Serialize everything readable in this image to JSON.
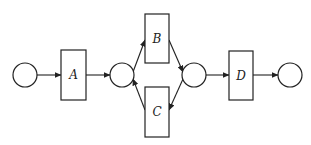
{
  "diagram": {
    "type": "petri-net",
    "colors": {
      "stroke": "#222222",
      "background": "#ffffff"
    },
    "places": [
      {
        "id": "p1",
        "cx": 25,
        "cy": 75,
        "r": 12
      },
      {
        "id": "p2",
        "cx": 122,
        "cy": 75,
        "r": 12
      },
      {
        "id": "p3",
        "cx": 194,
        "cy": 75,
        "r": 12
      },
      {
        "id": "p4",
        "cx": 290,
        "cy": 75,
        "r": 12
      }
    ],
    "transitions": [
      {
        "id": "A",
        "label": "A",
        "x": 61,
        "y": 50,
        "w": 25,
        "h": 50
      },
      {
        "id": "B",
        "label": "B",
        "x": 145,
        "y": 14,
        "w": 24,
        "h": 49
      },
      {
        "id": "C",
        "label": "C",
        "x": 145,
        "y": 87,
        "w": 24,
        "h": 50
      },
      {
        "id": "D",
        "label": "D",
        "x": 229,
        "y": 51,
        "w": 24,
        "h": 49
      }
    ],
    "arcs": [
      {
        "from": "p1",
        "to": "A"
      },
      {
        "from": "A",
        "to": "p2"
      },
      {
        "from": "p2",
        "to": "B"
      },
      {
        "from": "C",
        "to": "p2"
      },
      {
        "from": "B",
        "to": "p3"
      },
      {
        "from": "p3",
        "to": "C"
      },
      {
        "from": "p3",
        "to": "D"
      },
      {
        "from": "D",
        "to": "p4"
      }
    ]
  }
}
